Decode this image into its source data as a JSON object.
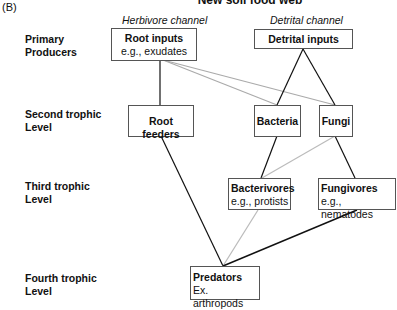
{
  "panel_label": "(B)",
  "title": "New soil food web",
  "channels": {
    "herbivore": "Herbivore channel",
    "detrital": "Detrital channel"
  },
  "levels": [
    {
      "line1": "Primary",
      "line2": "Producers"
    },
    {
      "line1": "Second trophic",
      "line2": "Level"
    },
    {
      "line1": "Third trophic",
      "line2": "Level"
    },
    {
      "line1": "Fourth trophic",
      "line2": "Level"
    }
  ],
  "nodes": {
    "root_inputs": {
      "name": "Root inputs",
      "example": "e.g., exudates"
    },
    "detrital_inputs": {
      "name": "Detrital inputs"
    },
    "root_feeders": {
      "name": "Root feeders"
    },
    "bacteria": {
      "name": "Bacteria"
    },
    "fungi": {
      "name": "Fungi"
    },
    "bacterivores": {
      "name": "Bacterivores",
      "example": "e.g., protists"
    },
    "fungivores": {
      "name": "Fungivores",
      "example": "e.g., nematodes"
    },
    "predators": {
      "name": "Predators",
      "example": "Ex. arthropods"
    }
  },
  "edges": [
    {
      "from": "root_inputs",
      "to": "root_feeders",
      "color": "#111111"
    },
    {
      "from": "root_inputs",
      "to": "bacteria",
      "color": "#aaaaaa"
    },
    {
      "from": "root_inputs",
      "to": "fungi",
      "color": "#aaaaaa"
    },
    {
      "from": "detrital_inputs",
      "to": "bacteria",
      "color": "#111111"
    },
    {
      "from": "detrital_inputs",
      "to": "fungi",
      "color": "#111111"
    },
    {
      "from": "bacteria",
      "to": "bacterivores",
      "color": "#111111"
    },
    {
      "from": "fungi",
      "to": "bacterivores",
      "color": "#bbbbbb"
    },
    {
      "from": "fungi",
      "to": "fungivores",
      "color": "#111111"
    },
    {
      "from": "root_feeders",
      "to": "predators",
      "color": "#111111"
    },
    {
      "from": "bacterivores",
      "to": "predators",
      "color": "#bbbbbb"
    },
    {
      "from": "fungivores",
      "to": "predators",
      "color": "#111111"
    }
  ]
}
